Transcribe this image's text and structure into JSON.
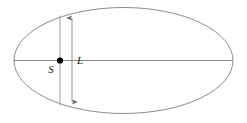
{
  "figure": {
    "background_color": "#ffffff",
    "width": 247,
    "height": 123,
    "stroke_color": "#8c8c8c",
    "dimension_color": "#8a8a8a",
    "marker_color": "#000000",
    "label_color": "#1a1a1a"
  },
  "ellipse": {
    "name": "ellipse-outline",
    "center_x": 123.5,
    "center_y": 60.5,
    "radius_x": 109.5,
    "radius_y": 53.0,
    "stroke_width": 1
  },
  "major_axis": {
    "name": "major-axis-line",
    "x1": 14,
    "y1": 60.5,
    "x2": 233,
    "y2": 60.5
  },
  "chord": {
    "name": "vertical-chord-line",
    "x": 60,
    "y_top": 15.5,
    "y_bottom": 105.5
  },
  "dimension": {
    "name": "dimension-line-L",
    "x": 72,
    "y_top": 18,
    "y_bottom": 102,
    "arrowhead_size": 4
  },
  "point": {
    "name": "point-S",
    "x": 60,
    "y": 60.5,
    "radius": 3.1
  },
  "labels": {
    "point_label": "S",
    "point_label_x": 51,
    "point_label_y": 73,
    "dimension_label": "L",
    "dimension_label_x": 78,
    "dimension_label_y": 64
  }
}
